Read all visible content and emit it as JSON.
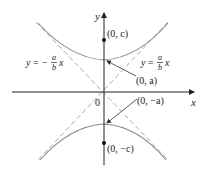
{
  "figure": {
    "axes": {
      "x_label": "x",
      "y_label": "y",
      "origin_label": "0"
    },
    "labels": {
      "focus_top": "(0, c)",
      "vertex_top": "(0, a)",
      "vertex_bottom": "(0, −a)",
      "focus_bottom": "(0, −c)"
    },
    "asymptotes": {
      "left": {
        "lhs": "y",
        "eq": "=",
        "sign": "−",
        "num": "a",
        "den": "b",
        "var": "x"
      },
      "right": {
        "lhs": "y",
        "eq": "=",
        "sign": "",
        "num": "a",
        "den": "b",
        "var": "x"
      }
    },
    "colors": {
      "axis": "#222222",
      "curve": "#8c8c8c",
      "asymptote": "#a0a0a0",
      "text": "#222222"
    }
  }
}
